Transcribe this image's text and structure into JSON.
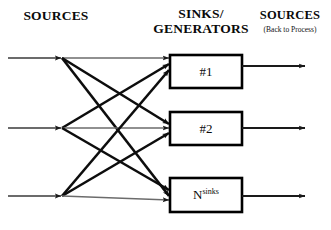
{
  "headers": {
    "sources_left": "SOURCES",
    "sinks_line1": "SINKS/",
    "sinks_line2": "GENERATORS",
    "sources_right": "SOURCES",
    "sources_right_sub": "(Back to Process)"
  },
  "boxes": [
    {
      "label": "#1",
      "sup": ""
    },
    {
      "label": "#2",
      "sup": ""
    },
    {
      "label": "N",
      "sup": "sinks"
    }
  ],
  "colors": {
    "background": "#ffffff",
    "text": "#0a0a0a",
    "box_stroke": "#000000",
    "diagonal_arrow": "#0d0d0d",
    "straight_line": "#6b6b6b",
    "output_arrow": "#1a1a1a"
  },
  "chart_data": {
    "type": "diagram",
    "source_nodes": [
      {
        "id": "s1",
        "x": 62,
        "y": 58,
        "line_start_x": 8
      },
      {
        "id": "s2",
        "x": 62,
        "y": 128,
        "line_start_x": 8
      },
      {
        "id": "s3",
        "x": 62,
        "y": 196,
        "line_start_x": 8
      }
    ],
    "sink_boxes": [
      {
        "id": "b1",
        "x": 170,
        "y": 55,
        "width": 72,
        "height": 33,
        "label": "#1"
      },
      {
        "id": "b2",
        "x": 170,
        "y": 112,
        "width": 72,
        "height": 33,
        "label": "#2"
      },
      {
        "id": "b3",
        "x": 170,
        "y": 178,
        "width": 72,
        "height": 34,
        "label": "Nsinks"
      }
    ],
    "edges": [
      {
        "from": "s1",
        "to": "b1",
        "style": "straight",
        "entry_y": 58
      },
      {
        "from": "s1",
        "to": "b2",
        "style": "diagonal",
        "entry_y": 124
      },
      {
        "from": "s1",
        "to": "b3",
        "style": "diagonal",
        "entry_y": 196
      },
      {
        "from": "s2",
        "to": "b1",
        "style": "diagonal",
        "entry_y": 64
      },
      {
        "from": "s2",
        "to": "b2",
        "style": "straight",
        "entry_y": 128
      },
      {
        "from": "s2",
        "to": "b3",
        "style": "diagonal",
        "entry_y": 190
      },
      {
        "from": "s3",
        "to": "b1",
        "style": "diagonal",
        "entry_y": 70
      },
      {
        "from": "s3",
        "to": "b2",
        "style": "diagonal",
        "entry_y": 133
      },
      {
        "from": "s3",
        "to": "b3",
        "style": "straight",
        "entry_y": 200
      }
    ],
    "outputs": [
      {
        "from": "b1",
        "y": 66,
        "x_start": 242,
        "x_end": 305
      },
      {
        "from": "b2",
        "y": 128,
        "x_start": 242,
        "x_end": 305
      },
      {
        "from": "b3",
        "y": 196,
        "x_start": 242,
        "x_end": 305
      }
    ]
  }
}
